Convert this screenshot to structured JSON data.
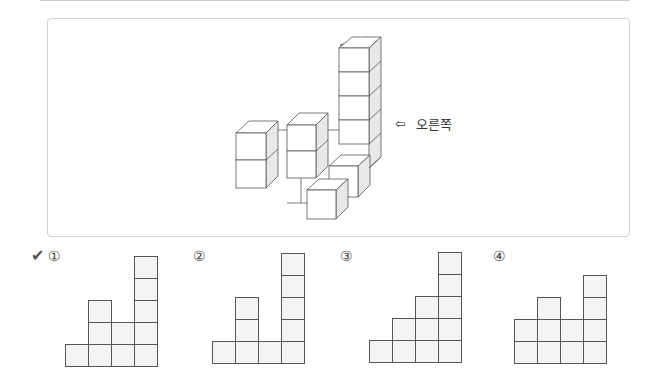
{
  "question": {
    "view_label": "오른쪽",
    "view_arrow": "⇦",
    "structure_description": "isometric stacked cubes viewed from the right"
  },
  "answer_mark": "✔",
  "options": [
    {
      "label": "①",
      "column_heights": [
        1,
        3,
        2,
        5
      ],
      "selected": true
    },
    {
      "label": "②",
      "column_heights": [
        1,
        3,
        1,
        5
      ],
      "selected": false
    },
    {
      "label": "③",
      "column_heights": [
        1,
        2,
        3,
        5
      ],
      "selected": false
    },
    {
      "label": "④",
      "column_heights": [
        2,
        3,
        2,
        4
      ],
      "selected": false
    }
  ]
}
